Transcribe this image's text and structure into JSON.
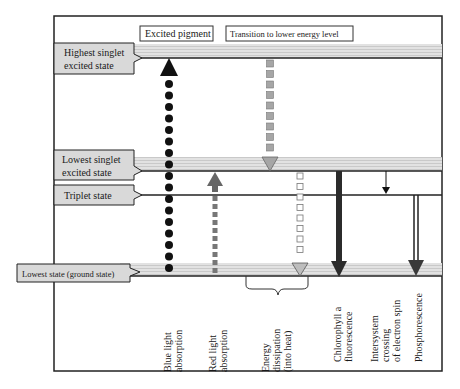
{
  "diagram": {
    "title_boxes": {
      "excited_pigment": "Excited pigment",
      "transition": "Transition to lower energy level"
    },
    "states": [
      {
        "id": "highest_singlet",
        "line1": "Highest singlet",
        "line2": "excited state"
      },
      {
        "id": "lowest_singlet",
        "line1": "Lowest singlet",
        "line2": "excited state"
      },
      {
        "id": "triplet",
        "line1": "Triplet state",
        "line2": ""
      },
      {
        "id": "ground",
        "line1": "Lowest state (ground state)",
        "line2": ""
      }
    ],
    "processes": [
      {
        "id": "blue",
        "line1": "Blue light",
        "line2": "absorption",
        "line3": ""
      },
      {
        "id": "red",
        "line1": "Red light",
        "line2": "absorption",
        "line3": ""
      },
      {
        "id": "heat",
        "line1": "Energy",
        "line2": "dissipation",
        "line3": "(into heat)"
      },
      {
        "id": "fluor",
        "line1": "Chlorophyll a",
        "line2": "fluorescence",
        "line3": ""
      },
      {
        "id": "isc",
        "line1": "Intersystem",
        "line2": "crossing",
        "line3": "of electron spin"
      },
      {
        "id": "phos",
        "line1": "Phosphorescence",
        "line2": "",
        "line3": ""
      }
    ],
    "colors": {
      "frame": "#222222",
      "band": "#d8d8d8",
      "tab_fill": "#d9d9d9",
      "blue_dots": "#111111",
      "red_arrow": "#666666",
      "transition_squares": "#a6a6a6",
      "fluorescence": "#2b2b2b"
    }
  }
}
